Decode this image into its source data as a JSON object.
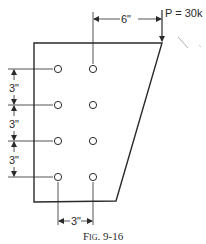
{
  "figure": {
    "caption": "Fig. 9-16",
    "type": "bolted bracket connection with eccentric load"
  },
  "load": {
    "label": "P = 30k",
    "symbol": "P",
    "value": "30k",
    "direction": "down"
  },
  "dimensions": {
    "eccentricity": "6\"",
    "vertical_pitch": [
      "3\"",
      "3\"",
      "3\""
    ],
    "horizontal_gage": "3\""
  },
  "bolts": {
    "columns": 2,
    "rows": 4,
    "count": 8
  },
  "colors": {
    "ink": "#2a2a2a",
    "background": "#ffffff"
  }
}
